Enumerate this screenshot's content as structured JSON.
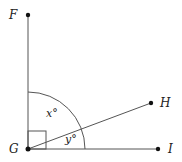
{
  "diagram": {
    "points": {
      "F": {
        "label": "F",
        "x": 28,
        "y": 15
      },
      "G": {
        "label": "G",
        "x": 28,
        "y": 149
      },
      "H": {
        "label": "H",
        "x": 151,
        "y": 103
      },
      "I": {
        "label": "I",
        "x": 158,
        "y": 149
      }
    },
    "angles": {
      "x": {
        "label": "x°"
      },
      "y": {
        "label": "y°"
      }
    },
    "right_angle_at": "G",
    "colors": {
      "line": "#555555",
      "point": "#111111"
    }
  }
}
